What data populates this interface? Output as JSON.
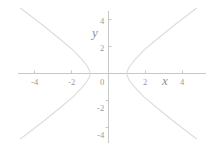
{
  "figure": {
    "width": 220,
    "height": 148,
    "background": "#ffffff",
    "curve_color": "#dcdcdc",
    "axis_color": "#c2c2c2",
    "text_color": "#9a9a9a"
  },
  "labels": {
    "x_axis_name": "x",
    "y_axis_name": "y"
  },
  "chart_data": {
    "type": "line",
    "title": "",
    "xlabel": "x",
    "ylabel": "y",
    "grid": false,
    "legend": null,
    "xlim": [
      -4.8,
      5.2
    ],
    "ylim": [
      -4.8,
      4.8
    ],
    "xticks": [
      -4,
      -2,
      0,
      2,
      4
    ],
    "xtick_labels": [
      "-4",
      "-2",
      "0",
      "2",
      "4"
    ],
    "yticks": [
      4,
      2,
      0,
      -2,
      -4
    ],
    "ytick_labels": [
      "4",
      "2",
      "0",
      "-2",
      "-4"
    ],
    "equation": "x^2 - y^2/7.3 = 1",
    "series": [
      {
        "name": "right-branch",
        "points": [
          [
            4.75,
            -4.8
          ],
          [
            3.6,
            -3.6
          ],
          [
            2.6,
            -2.5
          ],
          [
            1.9,
            -1.7
          ],
          [
            1.45,
            -1.05
          ],
          [
            1.15,
            -0.55
          ],
          [
            1.02,
            -0.2
          ],
          [
            1.0,
            0.0
          ],
          [
            1.02,
            0.2
          ],
          [
            1.15,
            0.55
          ],
          [
            1.45,
            1.05
          ],
          [
            1.9,
            1.7
          ],
          [
            2.6,
            2.5
          ],
          [
            3.6,
            3.6
          ],
          [
            4.75,
            4.8
          ]
        ]
      },
      {
        "name": "left-branch",
        "points": [
          [
            -4.75,
            -4.8
          ],
          [
            -3.6,
            -3.6
          ],
          [
            -2.6,
            -2.5
          ],
          [
            -1.9,
            -1.7
          ],
          [
            -1.45,
            -1.05
          ],
          [
            -1.15,
            -0.55
          ],
          [
            -1.02,
            -0.2
          ],
          [
            -1.0,
            0.0
          ],
          [
            -1.02,
            0.2
          ],
          [
            -1.15,
            0.55
          ],
          [
            -1.45,
            1.05
          ],
          [
            -1.9,
            1.7
          ],
          [
            -2.6,
            2.5
          ],
          [
            -3.6,
            3.6
          ],
          [
            -4.75,
            4.8
          ]
        ]
      }
    ]
  },
  "ticks": {
    "x": [
      {
        "value": "-4",
        "left": 31,
        "top": 78
      },
      {
        "value": "-2",
        "left": 68,
        "top": 78
      },
      {
        "value": "0",
        "left": 100,
        "top": 78
      },
      {
        "value": "2",
        "left": 143,
        "top": 78
      },
      {
        "value": "4",
        "left": 180,
        "top": 78
      }
    ],
    "y": [
      {
        "value": "4",
        "left": 100,
        "top": 17
      },
      {
        "value": "2",
        "left": 100,
        "top": 44
      },
      {
        "value": "-2",
        "left": 97,
        "top": 104
      },
      {
        "value": "-4",
        "left": 97,
        "top": 131
      }
    ]
  },
  "axis_name_positions": {
    "x": {
      "left": 162,
      "top": 74
    },
    "y": {
      "left": 92,
      "top": 26
    }
  }
}
